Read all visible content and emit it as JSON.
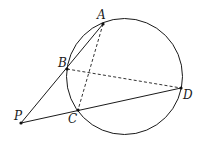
{
  "diagram": {
    "type": "geometry",
    "colors": {
      "stroke": "#1a1a1a",
      "background": "#ffffff"
    },
    "circle": {
      "cx": 124.5,
      "cy": 76.5,
      "r": 58
    },
    "points": [
      {
        "name": "A",
        "x": 103,
        "y": 24,
        "label": "A",
        "label_x": 97,
        "label_y": 19
      },
      {
        "name": "B",
        "x": 67,
        "y": 69,
        "label": "B",
        "label_x": 58,
        "label_y": 67
      },
      {
        "name": "C",
        "x": 78,
        "y": 110,
        "label": "C",
        "label_x": 68,
        "label_y": 123
      },
      {
        "name": "D",
        "x": 181,
        "y": 88,
        "label": "D",
        "label_x": 183,
        "label_y": 99
      },
      {
        "name": "P",
        "x": 21,
        "y": 123,
        "label": "P",
        "label_x": 14,
        "label_y": 120
      }
    ],
    "segments": [
      {
        "name": "PA",
        "from": "P",
        "to": "A",
        "style": "solid"
      },
      {
        "name": "PD",
        "from": "P",
        "to": "D",
        "style": "solid"
      },
      {
        "name": "AC",
        "from": "A",
        "to": "C",
        "style": "dashed"
      },
      {
        "name": "BD",
        "from": "B",
        "to": "D",
        "style": "dashed"
      }
    ]
  }
}
